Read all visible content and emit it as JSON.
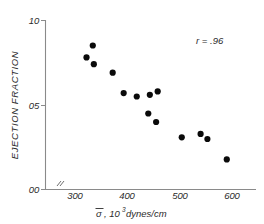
{
  "chart_data": {
    "type": "scatter",
    "title": "",
    "xlabel": "σ̄, 10³ dynes/cm",
    "xlabel_symbol": "σ",
    "xlabel_rest": ", 10",
    "xlabel_exponent": "3",
    "xlabel_units": " dynes/cm",
    "ylabel": "EJECTION  FRACTION",
    "xlim": [
      250,
      625
    ],
    "ylim": [
      0.0,
      1.0
    ],
    "xticks": [
      300,
      400,
      500,
      600
    ],
    "xtick_labels": [
      "300",
      "400",
      "500",
      "600"
    ],
    "yticks": [
      0.0,
      0.5,
      1.0
    ],
    "ytick_labels": [
      "00",
      "05",
      "10"
    ],
    "grid": false,
    "legend": null,
    "axis_break": true,
    "marker": "filled-circle",
    "marker_color": "#0a0a0a",
    "annotations": [
      {
        "text": "r = .96",
        "x": 555,
        "y": 0.9
      }
    ],
    "x": [
      322,
      334,
      336,
      372,
      393,
      418,
      440,
      443,
      455,
      458,
      504,
      540,
      553,
      590
    ],
    "y": [
      0.78,
      0.85,
      0.74,
      0.69,
      0.57,
      0.55,
      0.45,
      0.56,
      0.4,
      0.58,
      0.31,
      0.33,
      0.3,
      0.18
    ],
    "points": [
      {
        "x": 322,
        "y": 0.78
      },
      {
        "x": 334,
        "y": 0.85
      },
      {
        "x": 336,
        "y": 0.74
      },
      {
        "x": 372,
        "y": 0.69
      },
      {
        "x": 393,
        "y": 0.57
      },
      {
        "x": 418,
        "y": 0.55
      },
      {
        "x": 440,
        "y": 0.45
      },
      {
        "x": 443,
        "y": 0.56
      },
      {
        "x": 455,
        "y": 0.4
      },
      {
        "x": 458,
        "y": 0.58
      },
      {
        "x": 504,
        "y": 0.31
      },
      {
        "x": 540,
        "y": 0.33
      },
      {
        "x": 553,
        "y": 0.3
      },
      {
        "x": 590,
        "y": 0.18
      }
    ]
  }
}
